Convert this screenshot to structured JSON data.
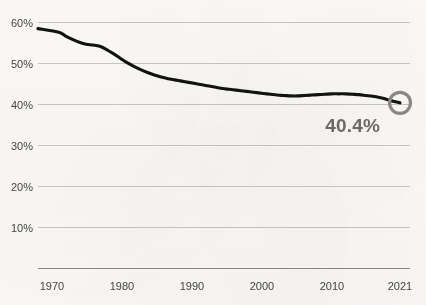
{
  "chart_data": {
    "type": "line",
    "title": "",
    "subtitle": "",
    "xlabel": "",
    "ylabel": "",
    "xlim": [
      1970,
      2021
    ],
    "ylim": [
      0,
      60
    ],
    "grid": true,
    "legend": "none",
    "y_tick_labels": [
      "60%",
      "50%",
      "40%",
      "30%",
      "20%",
      "10%"
    ],
    "y_tick_values": [
      60,
      50,
      40,
      30,
      20,
      10
    ],
    "x_tick_labels": [
      "1970",
      "1980",
      "1990",
      "2000",
      "2010",
      "2021"
    ],
    "x_tick_values": [
      1970,
      1980,
      1990,
      2000,
      2010,
      2021
    ],
    "series": [
      {
        "name": "share",
        "color": "#121212",
        "x": [
          1970,
          1971,
          1972,
          1973,
          1974,
          1975,
          1976,
          1977,
          1978,
          1979,
          1980,
          1981,
          1982,
          1983,
          1984,
          1985,
          1986,
          1987,
          1988,
          1989,
          1990,
          1991,
          1992,
          1993,
          1994,
          1995,
          1996,
          1997,
          1998,
          1999,
          2000,
          2001,
          2002,
          2003,
          2004,
          2005,
          2006,
          2007,
          2008,
          2009,
          2010,
          2011,
          2012,
          2013,
          2014,
          2015,
          2016,
          2017,
          2018,
          2019,
          2020,
          2021
        ],
        "values": [
          58.5,
          57.6,
          56.7,
          55.9,
          55.2,
          54.7,
          54.5,
          54.2,
          53.4,
          52.4,
          51.3,
          50.2,
          49.3,
          48.5,
          47.8,
          47.2,
          46.7,
          46.3,
          46.0,
          45.7,
          45.4,
          45.1,
          44.8,
          44.5,
          44.2,
          43.9,
          43.7,
          43.5,
          43.3,
          43.1,
          42.9,
          42.7,
          42.5,
          42.3,
          42.2,
          42.1,
          42.1,
          42.2,
          42.3,
          42.4,
          42.5,
          42.6,
          42.6,
          42.6,
          42.5,
          42.4,
          42.2,
          42.0,
          41.7,
          41.3,
          40.8,
          40.4
        ]
      }
    ],
    "annotations": [
      {
        "name": "end-value-callout",
        "text": "40.4%",
        "x": 2021,
        "y": 40.4,
        "color": "#6e6c69"
      }
    ],
    "endpoint_marker": {
      "name": "endpoint-ring",
      "x": 2021,
      "y": 40.4,
      "shape": "circle-outline",
      "color": "#8d8b88"
    },
    "colors": {
      "background": "#fbfaf7",
      "line": "#121212",
      "gridline": "#c9c7c4",
      "axis": "#8e8c89",
      "tick_text": "#454545",
      "callout": "#6e6c69",
      "marker": "#8d8b88"
    }
  }
}
